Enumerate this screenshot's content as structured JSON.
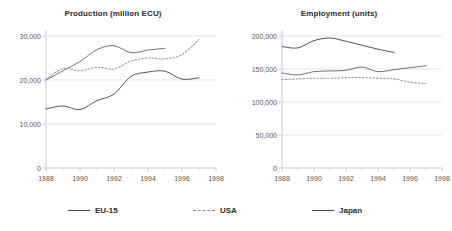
{
  "figure": {
    "background": "#ffffff",
    "text_color": "#333333"
  },
  "legend": {
    "position": "bottom",
    "items": [
      {
        "label": "EU-15",
        "style": "solid",
        "color": "#4a4a4a",
        "icon": "line-solid-icon"
      },
      {
        "label": "USA",
        "style": "dashed",
        "color": "#8a8a8a",
        "icon": "line-dashed-icon"
      },
      {
        "label": "Japan",
        "style": "solid",
        "color": "#4a4a4a",
        "icon": "line-solid-icon"
      }
    ]
  },
  "chart_data": [
    {
      "type": "line",
      "title": "Production (million ECU)",
      "xlabel": "",
      "ylabel": "",
      "xlim": [
        1988,
        1998
      ],
      "ylim": [
        0,
        30000
      ],
      "yticks": [
        0,
        10000,
        20000,
        30000
      ],
      "ytick_labels": [
        "0",
        "10,000",
        "20,000",
        "30,000"
      ],
      "xticks": [
        1988,
        1990,
        1992,
        1994,
        1996,
        1998
      ],
      "xtick_labels": [
        "1988",
        "1990",
        "1992",
        "1994",
        "1996",
        "1998"
      ],
      "xminor_ticks": [
        1989,
        1991,
        1993,
        1995,
        1997
      ],
      "grid": "horizontal",
      "legend_position": "figure-bottom",
      "series": [
        {
          "name": "EU-15",
          "style": "solid",
          "color": "#6b6b6b",
          "x": [
            1988,
            1989,
            1990,
            1991,
            1992,
            1993,
            1994,
            1995
          ],
          "values": [
            20000,
            22100,
            24200,
            26900,
            27800,
            26200,
            26800,
            27200
          ]
        },
        {
          "name": "USA",
          "style": "dashed",
          "color": "#9a9a9a",
          "x": [
            1988,
            1989,
            1990,
            1991,
            1992,
            1993,
            1994,
            1995,
            1996,
            1997
          ],
          "values": [
            20200,
            22600,
            22100,
            22900,
            22500,
            24300,
            25000,
            24800,
            25800,
            29200
          ]
        },
        {
          "name": "Japan",
          "style": "solid",
          "color": "#4a4a4a",
          "x": [
            1988,
            1989,
            1990,
            1991,
            1992,
            1993,
            1994,
            1995,
            1996,
            1997
          ],
          "values": [
            13400,
            14100,
            13300,
            15300,
            16800,
            20800,
            21800,
            22000,
            20200,
            20500
          ]
        }
      ]
    },
    {
      "type": "line",
      "title": "Employment (units)",
      "xlabel": "",
      "ylabel": "",
      "xlim": [
        1988,
        1998
      ],
      "ylim": [
        0,
        200000
      ],
      "yticks": [
        0,
        50000,
        100000,
        150000,
        200000
      ],
      "ytick_labels": [
        "0",
        "50,000",
        "100,000",
        "150,000",
        "200,000"
      ],
      "xticks": [
        1988,
        1990,
        1992,
        1994,
        1996,
        1998
      ],
      "xtick_labels": [
        "1988",
        "1990",
        "1992",
        "1994",
        "1996",
        "1998"
      ],
      "xminor_ticks": [
        1989,
        1991,
        1993,
        1995,
        1997
      ],
      "grid": "horizontal",
      "legend_position": "figure-bottom",
      "series": [
        {
          "name": "EU-15",
          "style": "solid",
          "color": "#6b6b6b",
          "x": [
            1988,
            1989,
            1990,
            1991,
            1992,
            1993,
            1994,
            1995,
            1996,
            1997
          ],
          "values": [
            144000,
            141000,
            146000,
            147000,
            148000,
            153000,
            146000,
            149000,
            152000,
            155000
          ]
        },
        {
          "name": "USA",
          "style": "dashed",
          "color": "#9a9a9a",
          "x": [
            1988,
            1989,
            1990,
            1991,
            1992,
            1993,
            1994,
            1995,
            1996,
            1997
          ],
          "values": [
            134000,
            135000,
            136000,
            136000,
            137000,
            137000,
            136000,
            135000,
            130000,
            128000
          ]
        },
        {
          "name": "Japan",
          "style": "solid",
          "color": "#4a4a4a",
          "x": [
            1988,
            1989,
            1990,
            1991,
            1992,
            1993,
            1994,
            1995
          ],
          "values": [
            184000,
            182000,
            193000,
            197000,
            192000,
            186000,
            180000,
            175000
          ]
        }
      ]
    }
  ]
}
